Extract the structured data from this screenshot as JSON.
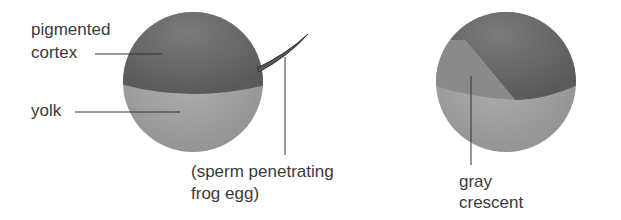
{
  "figure": {
    "left_egg": {
      "labels": {
        "pigmented_line1": "pigmented",
        "pigmented_line2": "cortex",
        "yolk": "yolk",
        "sperm_line1": "(sperm penetrating",
        "sperm_line2": "frog egg)"
      }
    },
    "right_egg": {
      "labels": {
        "gray_line1": "gray",
        "gray_line2": "crescent"
      }
    },
    "colors": {
      "pigmented": "#6e6e6e",
      "yolk": "#a8a8a8",
      "crescent": "#8c8c8c",
      "leader_line": "#333333"
    }
  }
}
